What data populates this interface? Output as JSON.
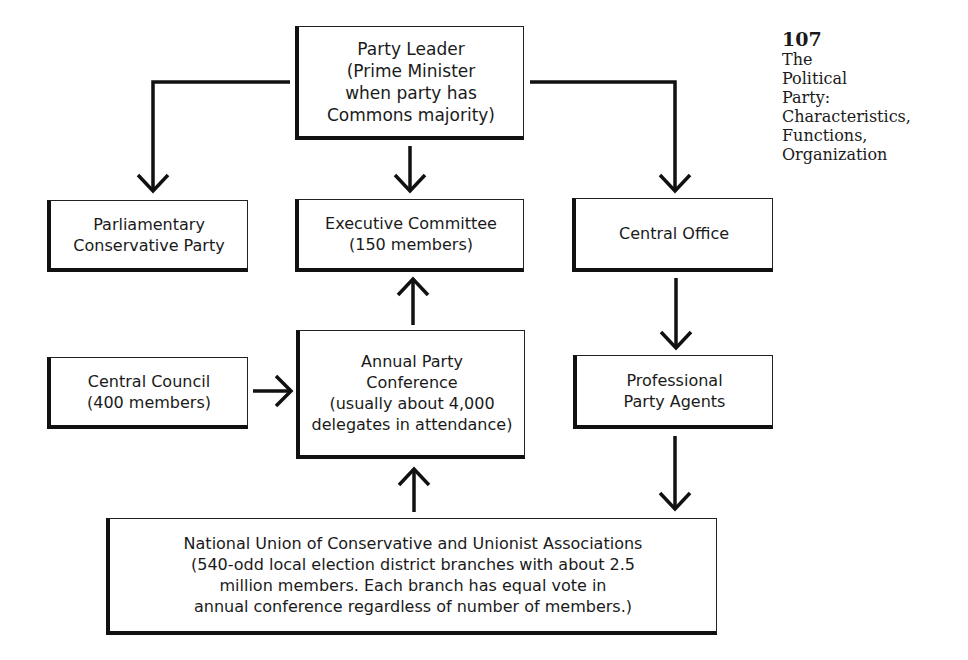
{
  "page": {
    "number": "107",
    "running_title": "The\nPolitical\nParty:\nCharacteristics,\nFunctions,\nOrganization"
  },
  "diagram": {
    "nodes": {
      "party_leader": {
        "label": "Party Leader\n(Prime Minister\nwhen party has\nCommons majority)"
      },
      "parliamentary_party": {
        "label": "Parliamentary\nConservative Party"
      },
      "executive_committee": {
        "label": "Executive Committee\n(150 members)"
      },
      "central_office": {
        "label": "Central Office"
      },
      "central_council": {
        "label": "Central Council\n(400 members)"
      },
      "annual_conference": {
        "label": "Annual Party\nConference\n(usually about 4,000\ndelegates in attendance)"
      },
      "party_agents": {
        "label": "Professional\nParty Agents"
      },
      "national_union": {
        "label": "National Union of Conservative and Unionist Associations\n(540-odd local election district branches with about 2.5\nmillion members.  Each branch has equal vote in\nannual conference regardless of number of members.)"
      }
    },
    "edges": [
      {
        "from": "party_leader",
        "to": "parliamentary_party"
      },
      {
        "from": "party_leader",
        "to": "executive_committee"
      },
      {
        "from": "party_leader",
        "to": "central_office"
      },
      {
        "from": "annual_conference",
        "to": "executive_committee"
      },
      {
        "from": "central_council",
        "to": "annual_conference"
      },
      {
        "from": "national_union",
        "to": "annual_conference"
      },
      {
        "from": "central_office",
        "to": "party_agents"
      },
      {
        "from": "party_agents",
        "to": "national_union"
      }
    ],
    "colors": {
      "line": "#111111",
      "background": "#ffffff"
    }
  }
}
